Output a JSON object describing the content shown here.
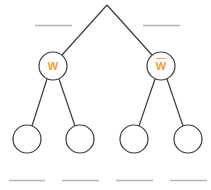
{
  "diagram": {
    "type": "binary-tree",
    "colors": {
      "edge": "#3a3a3a",
      "label": "#f0a030",
      "blank_line": "#b5b5b5"
    },
    "root": {
      "label": ""
    },
    "level1": [
      {
        "label": "W",
        "overline": false,
        "blank_above": ""
      },
      {
        "label": "W",
        "overline": true,
        "blank_above": ""
      }
    ],
    "leaves": [
      {
        "label": "",
        "blank_below": ""
      },
      {
        "label": "",
        "blank_below": ""
      },
      {
        "label": "",
        "blank_below": ""
      },
      {
        "label": "",
        "blank_below": ""
      }
    ]
  }
}
